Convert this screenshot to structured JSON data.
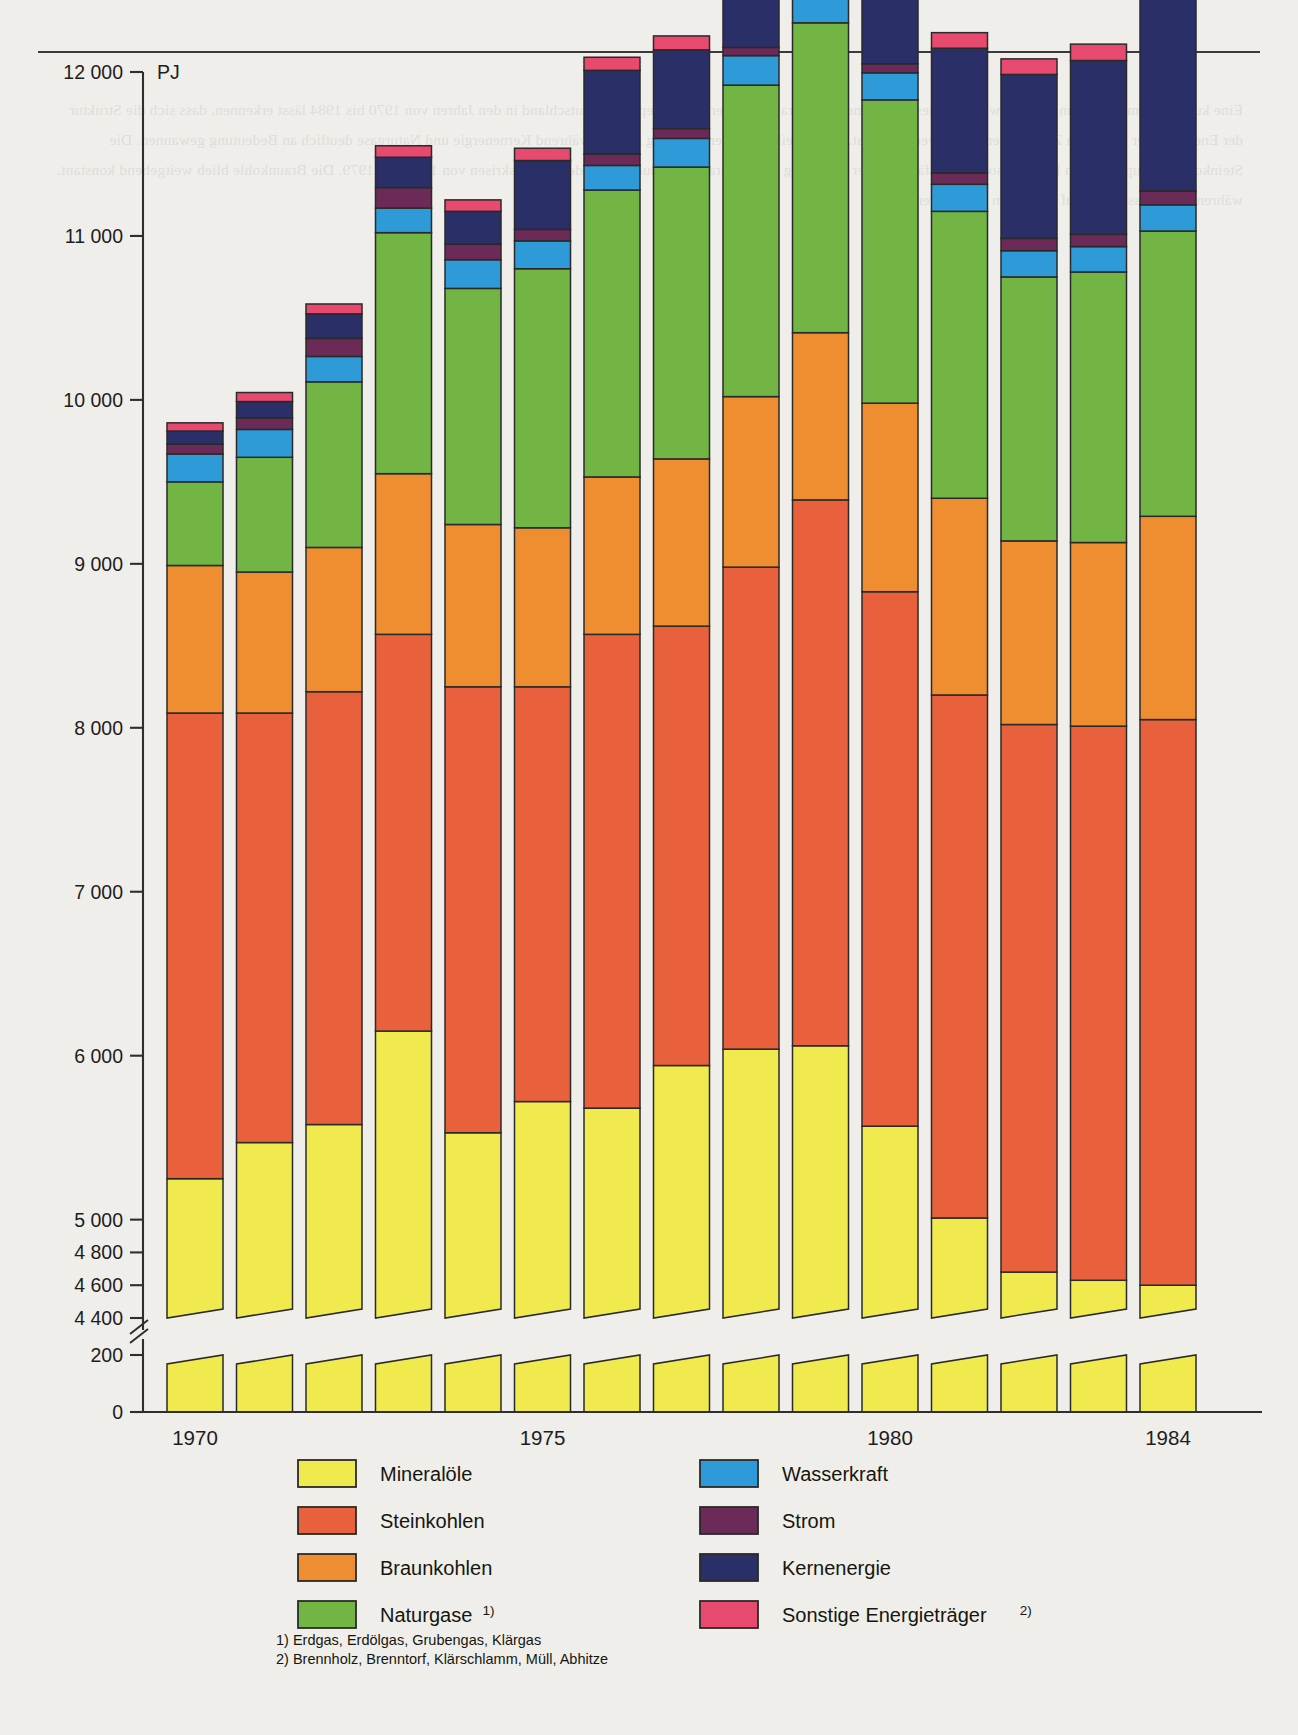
{
  "axis": {
    "unit": "PJ",
    "y_ticks_upper": [
      "12 000",
      "11 000",
      "10 000",
      "9 000",
      "8 000",
      "7 000",
      "6 000",
      "5 000",
      "4 800",
      "4 600",
      "4 400"
    ],
    "y_ticks_lower": [
      "200",
      "0"
    ],
    "x_tick_labels": [
      "1970",
      "1975",
      "1980",
      "1984"
    ],
    "break_note": "axis-break"
  },
  "legend": {
    "left": [
      {
        "label": "Mineralöle",
        "color": "#f0ea4e",
        "sup": ""
      },
      {
        "label": "Steinkohlen",
        "color": "#e8613c",
        "sup": ""
      },
      {
        "label": "Braunkohlen",
        "color": "#ef8e30",
        "sup": ""
      },
      {
        "label": "Naturgase",
        "color": "#72b545",
        "sup": "1)"
      }
    ],
    "right": [
      {
        "label": "Wasserkraft",
        "color": "#2e9ad8",
        "sup": ""
      },
      {
        "label": "Strom",
        "color": "#6b2a58",
        "sup": ""
      },
      {
        "label": "Kernenergie",
        "color": "#2b2f68",
        "sup": ""
      },
      {
        "label": "Sonstige Energieträger",
        "color": "#e8496e",
        "sup": "2)"
      }
    ]
  },
  "footnotes": [
    "1) Erdgas, Erdölgas, Grubengas, Klärgas",
    "2) Brennholz, Brenntorf, Klärschlamm, Müll, Abhitze"
  ],
  "chart_data": {
    "type": "bar",
    "title": "",
    "subtitle": "",
    "xlabel": "",
    "ylabel": "PJ",
    "stacked": true,
    "grid": false,
    "legend_position": "bottom",
    "ylim": [
      0,
      12000
    ],
    "axis_break": {
      "below": 4400,
      "resume": 200
    },
    "categories": [
      "1970",
      "1971",
      "1972",
      "1973",
      "1974",
      "1975",
      "1976",
      "1977",
      "1978",
      "1979",
      "1980",
      "1981",
      "1982",
      "1983",
      "1984"
    ],
    "series": [
      {
        "name": "Mineralöle",
        "color": "#f0ea4e",
        "values": [
          5250,
          5470,
          5580,
          6150,
          5530,
          5720,
          5680,
          5940,
          6040,
          6060,
          5570,
          5010,
          4680,
          4630,
          4600
        ]
      },
      {
        "name": "Steinkohlen",
        "color": "#e8613c",
        "values": [
          2840,
          2620,
          2640,
          2420,
          2720,
          2530,
          2890,
          2680,
          2940,
          3330,
          3260,
          3190,
          3340,
          3380,
          3450
        ]
      },
      {
        "name": "Braunkohlen",
        "color": "#ef8e30",
        "values": [
          900,
          860,
          880,
          980,
          990,
          970,
          960,
          1020,
          1040,
          1020,
          1150,
          1200,
          1120,
          1120,
          1240
        ]
      },
      {
        "name": "Naturgase",
        "color": "#72b545",
        "values": [
          510,
          700,
          1010,
          1470,
          1440,
          1580,
          1750,
          1780,
          1900,
          1890,
          1850,
          1750,
          1610,
          1650,
          1740
        ]
      },
      {
        "name": "Wasserkraft",
        "color": "#2e9ad8",
        "values": [
          170,
          170,
          155,
          150,
          175,
          170,
          150,
          175,
          180,
          160,
          165,
          165,
          160,
          155,
          160
        ]
      },
      {
        "name": "Strom",
        "color": "#6b2a58",
        "values": [
          60,
          70,
          110,
          125,
          95,
          70,
          70,
          60,
          50,
          45,
          55,
          70,
          75,
          75,
          85
        ]
      },
      {
        "name": "Kernenergie",
        "color": "#2b2f68",
        "values": [
          80,
          100,
          150,
          185,
          200,
          420,
          510,
          480,
          550,
          540,
          580,
          760,
          1000,
          1060,
          1450
        ]
      },
      {
        "name": "Sonstige Energieträger",
        "color": "#e8496e",
        "values": [
          50,
          55,
          60,
          70,
          70,
          75,
          80,
          85,
          85,
          90,
          90,
          95,
          95,
          100,
          100
        ]
      }
    ],
    "totals": [
      9860,
      10045,
      10585,
      11550,
      11220,
      11535,
      12090,
      12220,
      12789,
      13135,
      12720,
      12240,
      12080,
      12170,
      12825
    ]
  }
}
